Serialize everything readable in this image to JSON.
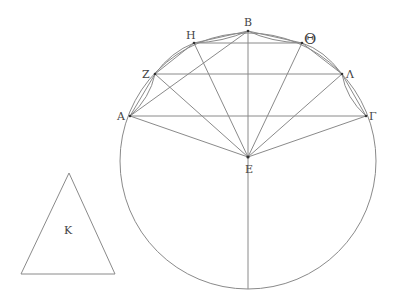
{
  "diagram": {
    "stroke_color": "#8a8a8a",
    "label_color": "#444444",
    "circle": {
      "cx": 248,
      "cy": 161,
      "r": 128
    },
    "points": {
      "A": {
        "label": "Α",
        "x": 130,
        "y": 116,
        "lx": 117,
        "ly": 120
      },
      "Z": {
        "label": "Ζ",
        "x": 155,
        "y": 74,
        "lx": 142,
        "ly": 78
      },
      "H": {
        "label": "Η",
        "x": 194,
        "y": 43,
        "lx": 186,
        "ly": 39
      },
      "B": {
        "label": "Β",
        "x": 248,
        "y": 31,
        "lx": 244,
        "ly": 26
      },
      "Theta": {
        "label": "Θ",
        "x": 302,
        "y": 43,
        "lx": 304,
        "ly": 44
      },
      "Lambda": {
        "label": "Λ",
        "x": 342,
        "y": 74,
        "lx": 346,
        "ly": 78
      },
      "Gamma": {
        "label": "Γ",
        "x": 366,
        "y": 116,
        "lx": 369,
        "ly": 120
      },
      "E": {
        "label": "Ε",
        "x": 248,
        "y": 157,
        "lx": 247,
        "ly": 172
      }
    },
    "triangle": {
      "label": "Κ",
      "apex": [
        69,
        173
      ],
      "base_left": [
        21,
        274
      ],
      "base_right": [
        115,
        274
      ],
      "label_pos": [
        65,
        233
      ]
    }
  }
}
